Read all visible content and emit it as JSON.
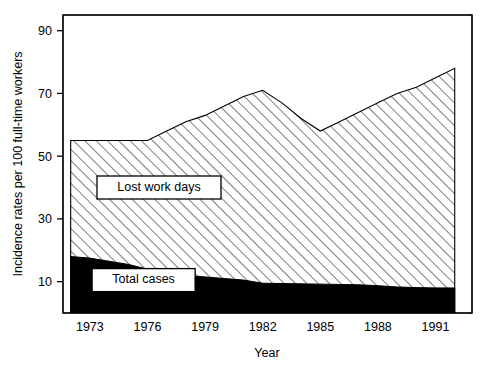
{
  "chart_data": {
    "type": "area",
    "title": "",
    "subtitle": "",
    "xlabel": "Year",
    "ylabel": "Incidence rates per 100 full-time workers",
    "xlim": [
      1971.6,
      1992.9
    ],
    "ylim": [
      0,
      95
    ],
    "xticks": [
      1973,
      1976,
      1979,
      1982,
      1985,
      1988,
      1991
    ],
    "xtick_labels": [
      "1973",
      "1976",
      "1979",
      "1982",
      "1985",
      "1988",
      "1991"
    ],
    "yticks": [
      10,
      30,
      50,
      70,
      90
    ],
    "ytick_labels": [
      "10",
      "30",
      "50",
      "70",
      "90"
    ],
    "grid": false,
    "legend_position": "inside-plot-labels",
    "stacked": true,
    "x": [
      1972,
      1973,
      1974,
      1975,
      1976,
      1977,
      1978,
      1979,
      1980,
      1981,
      1982,
      1983,
      1984,
      1985,
      1986,
      1987,
      1988,
      1989,
      1990,
      1991,
      1992
    ],
    "series": [
      {
        "name": "Lost work days",
        "fill": "hatched-diagonal",
        "color": "#000000",
        "values": [
          55,
          55,
          55,
          55,
          55,
          58,
          61,
          63,
          66,
          69,
          71,
          67,
          62,
          58,
          61,
          64,
          67,
          70,
          72,
          75,
          78
        ]
      },
      {
        "name": "Total cases",
        "fill": "solid-black",
        "color": "#000000",
        "values": [
          18,
          17.5,
          16.5,
          15.5,
          14,
          13,
          12,
          11.5,
          11,
          10.5,
          9.5,
          9.4,
          9.3,
          9.2,
          9.1,
          9,
          8.7,
          8.3,
          8.1,
          8,
          8
        ]
      }
    ],
    "annotations": [
      {
        "label": "Lost work days",
        "x": 1976.6,
        "y": 40
      },
      {
        "label": "Total cases",
        "x": 1975.8,
        "y": 10.5
      }
    ]
  },
  "axes": {
    "y_title": "Incidence rates per 100 full-time workers",
    "x_title": "Year",
    "y_ticks": [
      {
        "label": "90"
      },
      {
        "label": "70"
      },
      {
        "label": "50"
      },
      {
        "label": "30"
      },
      {
        "label": "10"
      }
    ],
    "x_ticks": [
      {
        "label": "1973"
      },
      {
        "label": "1976"
      },
      {
        "label": "1979"
      },
      {
        "label": "1982"
      },
      {
        "label": "1985"
      },
      {
        "label": "1988"
      },
      {
        "label": "1991"
      }
    ]
  },
  "legend": {
    "lost_work_days": "Lost work days",
    "total_cases": "Total cases"
  }
}
